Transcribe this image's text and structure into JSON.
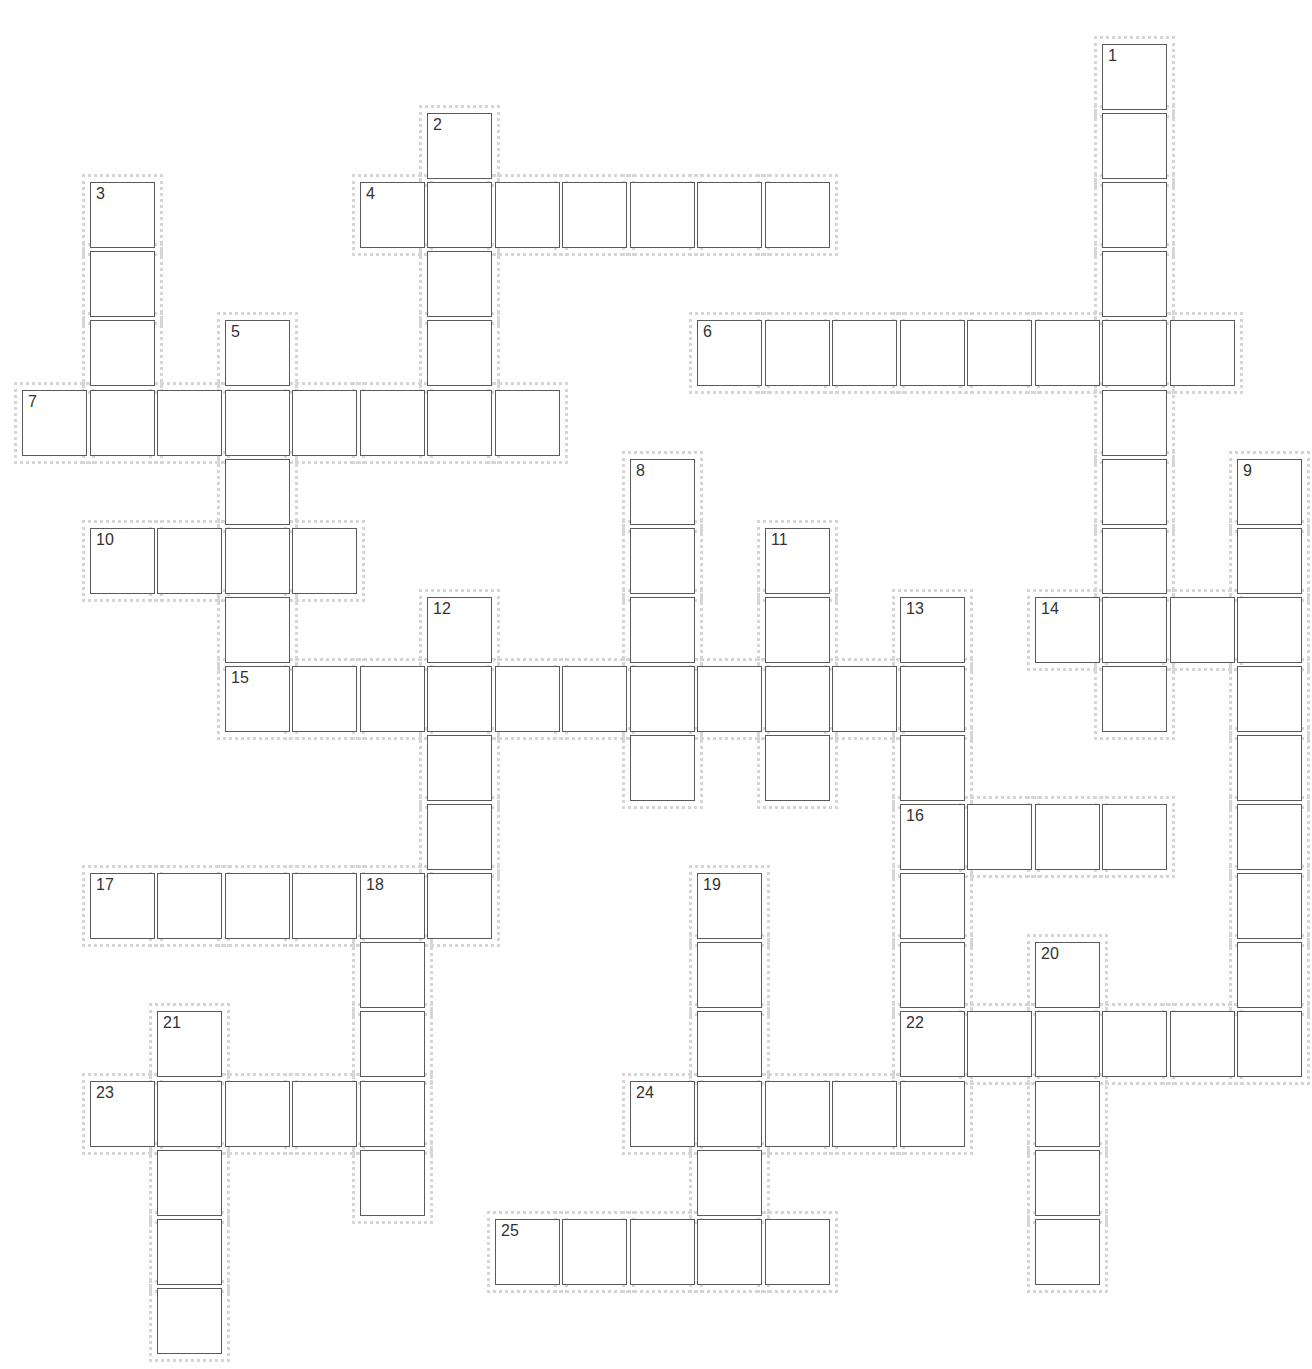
{
  "puzzle": {
    "layout": {
      "origin_x": 22,
      "origin_y": 44,
      "pitch_x": 67.5,
      "pitch_y": 69.1,
      "columns": 19,
      "rows": 19,
      "cell_border_color": "#5a5a5a",
      "halo_color": "#d6d6d6",
      "number_color": "#333333"
    },
    "words": [
      {
        "number": 1,
        "direction": "down",
        "row": 0,
        "col": 16,
        "length": 10
      },
      {
        "number": 2,
        "direction": "down",
        "row": 1,
        "col": 6,
        "length": 5
      },
      {
        "number": 3,
        "direction": "down",
        "row": 2,
        "col": 1,
        "length": 4
      },
      {
        "number": 4,
        "direction": "across",
        "row": 2,
        "col": 5,
        "length": 7
      },
      {
        "number": 5,
        "direction": "down",
        "row": 4,
        "col": 3,
        "length": 5
      },
      {
        "number": 6,
        "direction": "across",
        "row": 4,
        "col": 10,
        "length": 8
      },
      {
        "number": 7,
        "direction": "across",
        "row": 5,
        "col": 0,
        "length": 8
      },
      {
        "number": 8,
        "direction": "down",
        "row": 6,
        "col": 9,
        "length": 5
      },
      {
        "number": 9,
        "direction": "down",
        "row": 6,
        "col": 18,
        "length": 9
      },
      {
        "number": 10,
        "direction": "across",
        "row": 7,
        "col": 1,
        "length": 4
      },
      {
        "number": 11,
        "direction": "down",
        "row": 7,
        "col": 11,
        "length": 4
      },
      {
        "number": 12,
        "direction": "down",
        "row": 8,
        "col": 6,
        "length": 5
      },
      {
        "number": 13,
        "direction": "down",
        "row": 8,
        "col": 13,
        "length": 6
      },
      {
        "number": 14,
        "direction": "across",
        "row": 8,
        "col": 15,
        "length": 4
      },
      {
        "number": 15,
        "direction": "across",
        "row": 9,
        "col": 3,
        "length": 11
      },
      {
        "number": 16,
        "direction": "across",
        "row": 11,
        "col": 13,
        "length": 4
      },
      {
        "number": 17,
        "direction": "across",
        "row": 12,
        "col": 1,
        "length": 6
      },
      {
        "number": 18,
        "direction": "down",
        "row": 12,
        "col": 5,
        "length": 5
      },
      {
        "number": 19,
        "direction": "down",
        "row": 12,
        "col": 10,
        "length": 5
      },
      {
        "number": 20,
        "direction": "down",
        "row": 13,
        "col": 15,
        "length": 5
      },
      {
        "number": 21,
        "direction": "down",
        "row": 14,
        "col": 2,
        "length": 5
      },
      {
        "number": 22,
        "direction": "across",
        "row": 14,
        "col": 13,
        "length": 6
      },
      {
        "number": 23,
        "direction": "across",
        "row": 15,
        "col": 1,
        "length": 5
      },
      {
        "number": 24,
        "direction": "across",
        "row": 15,
        "col": 9,
        "length": 5
      },
      {
        "number": 25,
        "direction": "across",
        "row": 17,
        "col": 7,
        "length": 5
      }
    ],
    "entries": {}
  }
}
